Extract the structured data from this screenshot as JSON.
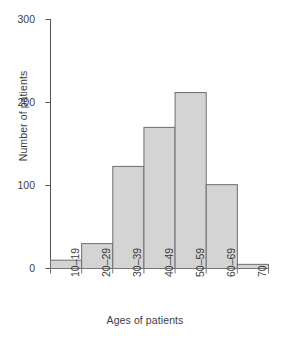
{
  "chart_data": {
    "type": "bar",
    "title": "",
    "subtitle": "",
    "xlabel": "Ages of patients",
    "ylabel": "Number of patients",
    "categories": [
      "10–19",
      "20–29",
      "30–39",
      "40–49",
      "50–59",
      "60–69",
      "70"
    ],
    "values": [
      10,
      30,
      123,
      170,
      212,
      101,
      5
    ],
    "ylim": [
      0,
      300
    ],
    "yticks": [
      0,
      100,
      200,
      300
    ],
    "ytick_labels": [
      "0",
      "100",
      "200",
      "300"
    ],
    "xtick_labels": [
      "10–19",
      "20–29",
      "30–39",
      "40–49",
      "50–59",
      "60–69",
      "70"
    ],
    "grid": false,
    "legend": null,
    "legend_position": "none",
    "bar_fill": "#d4d4d4",
    "bar_stroke": "#6e6e6e",
    "axis_color": "#555555",
    "text_color": "#3d3d3d",
    "annotations": []
  },
  "axes": {
    "y_title": "Number of patients",
    "x_title": "Ages of patients",
    "y_ticks": [
      {
        "label": "300",
        "value": 300
      },
      {
        "label": "200",
        "value": 200
      },
      {
        "label": "100",
        "value": 100
      },
      {
        "label": "0",
        "value": 0
      }
    ],
    "x_ticks": [
      {
        "label": "10–19"
      },
      {
        "label": "20–29"
      },
      {
        "label": "30–39"
      },
      {
        "label": "40–49"
      },
      {
        "label": "50–59"
      },
      {
        "label": "60–69"
      },
      {
        "label": "70"
      }
    ]
  }
}
